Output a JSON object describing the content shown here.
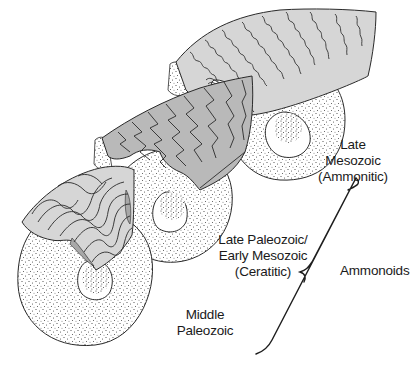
{
  "diagram": {
    "group_label": "Ammonoids",
    "stages": [
      {
        "id": "middle-paleozoic",
        "lines": [
          "Middle",
          "Paleozoic"
        ],
        "type": "goniatitic"
      },
      {
        "id": "late-paleozoic-early-mesozoic",
        "lines": [
          "Late Paleozoic/",
          "Early Mesozoic",
          "(Ceratitic)"
        ],
        "type": "ceratitic"
      },
      {
        "id": "late-mesozoic",
        "lines": [
          "Late",
          "Mesozoic",
          "(Ammonitic)"
        ],
        "type": "ammonitic"
      }
    ],
    "colors": {
      "line": "#2a2a2a",
      "shell_fill_light": "#d6d6d6",
      "shell_fill_mid": "#b9b9b9",
      "stipple": "#3a3a3a",
      "background": "#ffffff"
    }
  }
}
